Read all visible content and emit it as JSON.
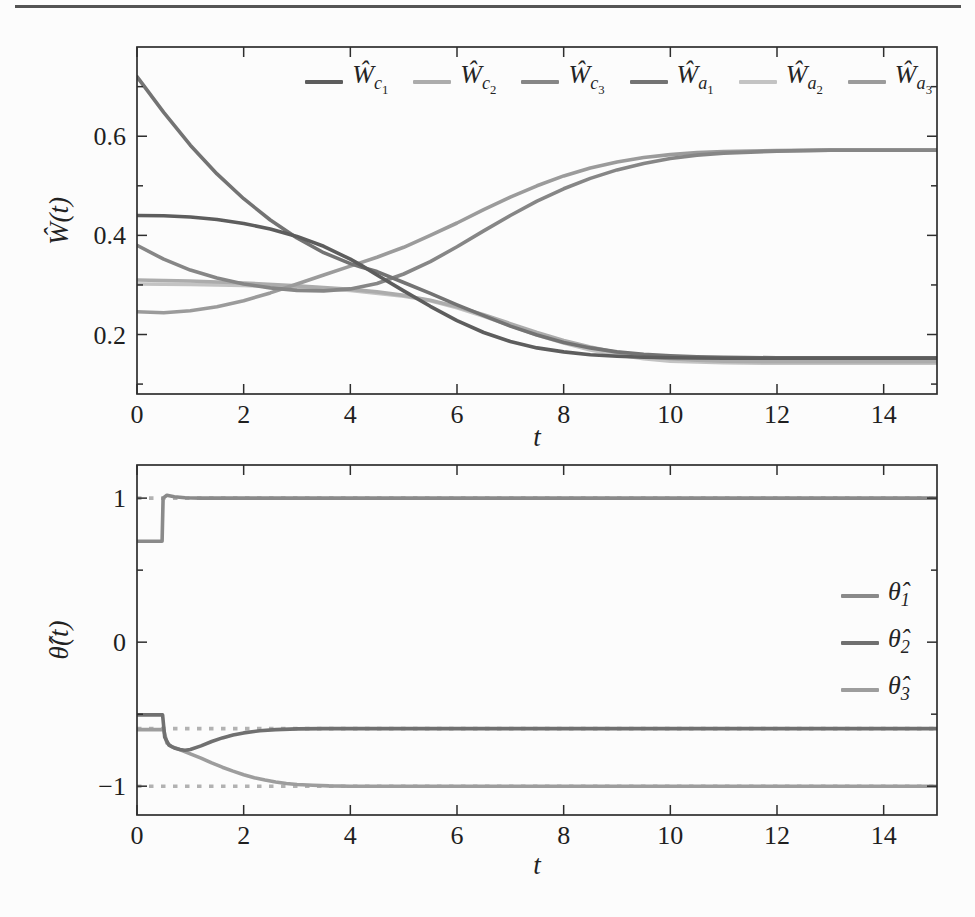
{
  "page": {
    "background": "#fcfcfc",
    "top_rule_color": "#545454",
    "frame_color": "#2e2e2e"
  },
  "chart_data": [
    {
      "id": "weights",
      "type": "line",
      "title": "",
      "xlabel": "t",
      "ylabel": "Ŵ(t)",
      "xlim": [
        0,
        15
      ],
      "ylim": [
        0.08,
        0.78
      ],
      "grid": false,
      "xticks": {
        "major": [
          0,
          2,
          4,
          6,
          8,
          10,
          12,
          14
        ],
        "labels": [
          "0",
          "2",
          "4",
          "6",
          "8",
          "10",
          "12",
          "14"
        ],
        "minor": []
      },
      "yticks": {
        "major": [
          0.2,
          0.4,
          0.6
        ],
        "labels": [
          "0.2",
          "0.4",
          "0.6"
        ],
        "minor": [
          0.1,
          0.3,
          0.5,
          0.7
        ]
      },
      "legend": {
        "position": "inside-top-horizontal",
        "items": [
          {
            "text": "Wc1",
            "main": "Ŵ",
            "sub": "c",
            "subsub": "1",
            "color": "#5d5d5d"
          },
          {
            "text": "Wc2",
            "main": "Ŵ",
            "sub": "c",
            "subsub": "2",
            "color": "#acacac"
          },
          {
            "text": "Wc3",
            "main": "Ŵ",
            "sub": "c",
            "subsub": "3",
            "color": "#868686"
          },
          {
            "text": "Wa1",
            "main": "Ŵ",
            "sub": "a",
            "subsub": "1",
            "color": "#737373"
          },
          {
            "text": "Wa2",
            "main": "Ŵ",
            "sub": "a",
            "subsub": "2",
            "color": "#c3c3c3"
          },
          {
            "text": "Wa3",
            "main": "Ŵ",
            "sub": "a",
            "subsub": "3",
            "color": "#9b9b9b"
          }
        ]
      },
      "series": [
        {
          "name": "Wc1",
          "color": "#5d5d5d",
          "final_value": 0.152,
          "points": [
            [
              0,
              0.44
            ],
            [
              0.5,
              0.4395
            ],
            [
              1,
              0.437
            ],
            [
              1.5,
              0.432
            ],
            [
              2,
              0.424
            ],
            [
              2.5,
              0.413
            ],
            [
              3,
              0.398
            ],
            [
              3.5,
              0.378
            ],
            [
              4,
              0.352
            ],
            [
              4.2,
              0.34
            ],
            [
              4.5,
              0.32
            ],
            [
              5,
              0.288
            ],
            [
              5.5,
              0.257
            ],
            [
              6,
              0.228
            ],
            [
              6.5,
              0.204
            ],
            [
              7,
              0.186
            ],
            [
              7.5,
              0.173
            ],
            [
              8,
              0.165
            ],
            [
              8.5,
              0.159
            ],
            [
              9,
              0.156
            ],
            [
              9.5,
              0.154
            ],
            [
              10,
              0.153
            ],
            [
              11,
              0.152
            ],
            [
              12,
              0.152
            ],
            [
              15,
              0.152
            ]
          ]
        },
        {
          "name": "Wc2",
          "color": "#acacac",
          "final_value": 0.145,
          "points": [
            [
              0,
              0.31
            ],
            [
              1,
              0.308
            ],
            [
              2,
              0.304
            ],
            [
              3,
              0.298
            ],
            [
              4,
              0.291
            ],
            [
              4.5,
              0.286
            ],
            [
              5,
              0.279
            ],
            [
              5.5,
              0.269
            ],
            [
              6,
              0.256
            ],
            [
              6.5,
              0.24
            ],
            [
              7,
              0.222
            ],
            [
              7.5,
              0.204
            ],
            [
              8,
              0.188
            ],
            [
              8.5,
              0.175
            ],
            [
              9,
              0.164
            ],
            [
              9.5,
              0.156
            ],
            [
              10,
              0.151
            ],
            [
              10.5,
              0.148
            ],
            [
              11,
              0.146
            ],
            [
              12,
              0.145
            ],
            [
              15,
              0.145
            ]
          ]
        },
        {
          "name": "Wc3",
          "color": "#868686",
          "final_value": 0.572,
          "points": [
            [
              0,
              0.38
            ],
            [
              0.5,
              0.352
            ],
            [
              1,
              0.33
            ],
            [
              1.5,
              0.314
            ],
            [
              2,
              0.302
            ],
            [
              2.5,
              0.294
            ],
            [
              3,
              0.289
            ],
            [
              3.5,
              0.288
            ],
            [
              4,
              0.292
            ],
            [
              4.5,
              0.303
            ],
            [
              5,
              0.322
            ],
            [
              5.5,
              0.347
            ],
            [
              6,
              0.377
            ],
            [
              6.5,
              0.409
            ],
            [
              7,
              0.44
            ],
            [
              7.5,
              0.469
            ],
            [
              8,
              0.494
            ],
            [
              8.5,
              0.515
            ],
            [
              9,
              0.532
            ],
            [
              9.5,
              0.545
            ],
            [
              10,
              0.555
            ],
            [
              10.5,
              0.562
            ],
            [
              11,
              0.566
            ],
            [
              12,
              0.57
            ],
            [
              13,
              0.572
            ],
            [
              15,
              0.572
            ]
          ]
        },
        {
          "name": "Wa1",
          "color": "#737373",
          "final_value": 0.153,
          "points": [
            [
              0,
              0.72
            ],
            [
              0.5,
              0.648
            ],
            [
              1,
              0.582
            ],
            [
              1.5,
              0.524
            ],
            [
              2,
              0.474
            ],
            [
              2.5,
              0.431
            ],
            [
              3,
              0.395
            ],
            [
              3.5,
              0.365
            ],
            [
              4,
              0.343
            ],
            [
              4.2,
              0.336
            ],
            [
              4.5,
              0.327
            ],
            [
              5,
              0.305
            ],
            [
              5.5,
              0.283
            ],
            [
              6,
              0.26
            ],
            [
              6.5,
              0.238
            ],
            [
              7,
              0.217
            ],
            [
              7.5,
              0.199
            ],
            [
              8,
              0.184
            ],
            [
              8.5,
              0.173
            ],
            [
              9,
              0.165
            ],
            [
              9.5,
              0.16
            ],
            [
              10,
              0.157
            ],
            [
              10.5,
              0.155
            ],
            [
              11,
              0.154
            ],
            [
              12,
              0.153
            ],
            [
              15,
              0.153
            ]
          ]
        },
        {
          "name": "Wa2",
          "color": "#c3c3c3",
          "final_value": 0.142,
          "points": [
            [
              0,
              0.302
            ],
            [
              1,
              0.301
            ],
            [
              2,
              0.299
            ],
            [
              3,
              0.295
            ],
            [
              4,
              0.289
            ],
            [
              5,
              0.277
            ],
            [
              5.5,
              0.268
            ],
            [
              6,
              0.254
            ],
            [
              6.5,
              0.237
            ],
            [
              7,
              0.218
            ],
            [
              7.5,
              0.199
            ],
            [
              8,
              0.183
            ],
            [
              8.5,
              0.169
            ],
            [
              9,
              0.159
            ],
            [
              9.5,
              0.151
            ],
            [
              10,
              0.146
            ],
            [
              11,
              0.143
            ],
            [
              12,
              0.142
            ],
            [
              15,
              0.142
            ]
          ]
        },
        {
          "name": "Wa3",
          "color": "#9b9b9b",
          "final_value": 0.572,
          "points": [
            [
              0,
              0.246
            ],
            [
              0.5,
              0.244
            ],
            [
              1,
              0.248
            ],
            [
              1.5,
              0.256
            ],
            [
              2,
              0.268
            ],
            [
              2.5,
              0.284
            ],
            [
              3,
              0.302
            ],
            [
              3.5,
              0.32
            ],
            [
              4,
              0.338
            ],
            [
              4.5,
              0.356
            ],
            [
              5,
              0.376
            ],
            [
              5.5,
              0.4
            ],
            [
              6,
              0.425
            ],
            [
              6.5,
              0.452
            ],
            [
              7,
              0.477
            ],
            [
              7.5,
              0.5
            ],
            [
              8,
              0.52
            ],
            [
              8.5,
              0.536
            ],
            [
              9,
              0.548
            ],
            [
              9.5,
              0.557
            ],
            [
              10,
              0.563
            ],
            [
              10.5,
              0.567
            ],
            [
              11,
              0.569
            ],
            [
              12,
              0.571
            ],
            [
              13,
              0.572
            ],
            [
              15,
              0.572
            ]
          ]
        }
      ]
    },
    {
      "id": "theta",
      "type": "line",
      "title": "",
      "xlabel": "t",
      "ylabel": "θ̂(t)",
      "xlim": [
        0,
        15
      ],
      "ylim": [
        -1.2,
        1.23
      ],
      "grid": false,
      "xticks": {
        "major": [
          0,
          2,
          4,
          6,
          8,
          10,
          12,
          14
        ],
        "labels": [
          "0",
          "2",
          "4",
          "6",
          "8",
          "10",
          "12",
          "14"
        ],
        "minor": []
      },
      "yticks": {
        "major": [
          -1,
          0,
          1
        ],
        "labels": [
          "−1",
          "0",
          "1"
        ],
        "minor": [
          -0.5,
          0.5
        ]
      },
      "refs": [
        {
          "y": 1.0
        },
        {
          "y": -0.6
        },
        {
          "y": -1.0
        }
      ],
      "ref_color": "#b2b2b2",
      "ref_style": "dotted",
      "legend": {
        "position": "inside-right-vertical",
        "items": [
          {
            "text": "theta1",
            "main": "θ̂",
            "sub": "1",
            "subsub": "",
            "color": "#8a8a8a"
          },
          {
            "text": "theta2",
            "main": "θ̂",
            "sub": "2",
            "subsub": "",
            "color": "#707070"
          },
          {
            "text": "theta3",
            "main": "θ̂",
            "sub": "3",
            "subsub": "",
            "color": "#9d9d9d"
          }
        ]
      },
      "series": [
        {
          "name": "theta1",
          "color": "#8a8a8a",
          "final_value": 1.0,
          "points": [
            [
              0,
              0.7
            ],
            [
              0.47,
              0.7
            ],
            [
              0.49,
              1.0
            ],
            [
              0.56,
              1.02
            ],
            [
              0.7,
              1.01
            ],
            [
              0.9,
              1.003
            ],
            [
              1.2,
              1.0
            ],
            [
              15,
              1.0
            ]
          ]
        },
        {
          "name": "theta2",
          "color": "#707070",
          "final_value": -0.6,
          "points": [
            [
              0,
              -0.505
            ],
            [
              0.48,
              -0.505
            ],
            [
              0.52,
              -0.66
            ],
            [
              0.6,
              -0.715
            ],
            [
              0.7,
              -0.735
            ],
            [
              0.8,
              -0.745
            ],
            [
              0.9,
              -0.75
            ],
            [
              1.0,
              -0.745
            ],
            [
              1.2,
              -0.72
            ],
            [
              1.4,
              -0.69
            ],
            [
              1.6,
              -0.665
            ],
            [
              1.8,
              -0.645
            ],
            [
              2.0,
              -0.63
            ],
            [
              2.3,
              -0.615
            ],
            [
              2.6,
              -0.607
            ],
            [
              3.0,
              -0.602
            ],
            [
              3.5,
              -0.6
            ],
            [
              15,
              -0.6
            ]
          ]
        },
        {
          "name": "theta3",
          "color": "#9d9d9d",
          "final_value": -1.0,
          "points": [
            [
              0,
              -0.607
            ],
            [
              0.5,
              -0.607
            ],
            [
              0.56,
              -0.7
            ],
            [
              0.65,
              -0.725
            ],
            [
              0.8,
              -0.745
            ],
            [
              1.0,
              -0.775
            ],
            [
              1.2,
              -0.805
            ],
            [
              1.4,
              -0.838
            ],
            [
              1.6,
              -0.868
            ],
            [
              1.8,
              -0.895
            ],
            [
              2.0,
              -0.92
            ],
            [
              2.2,
              -0.941
            ],
            [
              2.4,
              -0.958
            ],
            [
              2.6,
              -0.971
            ],
            [
              2.8,
              -0.981
            ],
            [
              3.0,
              -0.988
            ],
            [
              3.3,
              -0.994
            ],
            [
              3.6,
              -0.998
            ],
            [
              4.0,
              -1.0
            ],
            [
              15,
              -1.0
            ]
          ]
        }
      ]
    }
  ]
}
